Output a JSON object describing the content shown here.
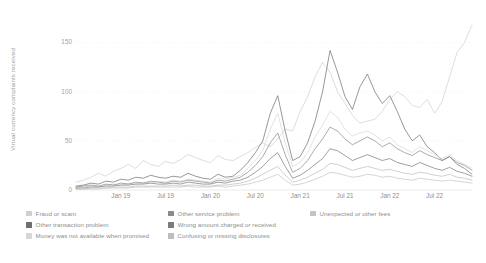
{
  "chart_data": {
    "type": "line",
    "title": "",
    "xlabel": "",
    "ylabel": "Virtual currency complaints received",
    "ylim": [
      0,
      175
    ],
    "yticks": [
      0,
      50,
      100,
      150
    ],
    "ytick_labels": [
      "0",
      "50",
      "100",
      "150"
    ],
    "xtick_labels": [
      "Jan 19",
      "Jul 19",
      "Jan 20",
      "Jul 20",
      "Jan 21",
      "Jul 21",
      "Jan 22",
      "Jul 22"
    ],
    "xtick_positions": [
      6,
      12,
      18,
      24,
      30,
      36,
      42,
      48
    ],
    "x": [
      0,
      1,
      2,
      3,
      4,
      5,
      6,
      7,
      8,
      9,
      10,
      11,
      12,
      13,
      14,
      15,
      16,
      17,
      18,
      19,
      20,
      21,
      22,
      23,
      24,
      25,
      26,
      27,
      28,
      29,
      30,
      31,
      32,
      33,
      34,
      35,
      36,
      37,
      38,
      39,
      40,
      41,
      42,
      43,
      44,
      45,
      46,
      47,
      48,
      49,
      50,
      51,
      52,
      53
    ],
    "grid": true,
    "legend_position": "bottom",
    "legend_columns": 3,
    "series": [
      {
        "name": "Fraud or scam",
        "color": "#cfcfcf",
        "values": [
          8,
          10,
          13,
          17,
          14,
          19,
          22,
          26,
          22,
          30,
          26,
          24,
          29,
          27,
          31,
          36,
          33,
          30,
          28,
          35,
          31,
          30,
          34,
          38,
          43,
          48,
          44,
          52,
          62,
          60,
          80,
          95,
          115,
          130,
          120,
          100,
          88,
          76,
          68,
          70,
          72,
          80,
          92,
          100,
          95,
          86,
          84,
          92,
          78,
          90,
          115,
          140,
          150,
          168
        ]
      },
      {
        "name": "Other transaction problem",
        "color": "#6f6f6f",
        "values": [
          4,
          5,
          7,
          6,
          9,
          8,
          11,
          10,
          13,
          12,
          15,
          13,
          12,
          14,
          13,
          17,
          14,
          12,
          11,
          16,
          13,
          14,
          20,
          28,
          38,
          50,
          78,
          96,
          60,
          30,
          34,
          48,
          70,
          100,
          142,
          120,
          95,
          82,
          105,
          118,
          100,
          88,
          96,
          80,
          62,
          50,
          56,
          44,
          38,
          30,
          34,
          26,
          22,
          16
        ]
      },
      {
        "name": "Money was not available when promised",
        "color": "#d6d6d6",
        "values": [
          2,
          3,
          4,
          3,
          5,
          6,
          5,
          7,
          6,
          8,
          7,
          9,
          8,
          10,
          9,
          11,
          10,
          9,
          8,
          12,
          11,
          13,
          15,
          22,
          30,
          40,
          62,
          78,
          48,
          24,
          28,
          38,
          54,
          66,
          80,
          74,
          62,
          55,
          58,
          60,
          56,
          50,
          54,
          46,
          42,
          38,
          44,
          40,
          36,
          32,
          36,
          30,
          26,
          22
        ]
      },
      {
        "name": "Other service problem",
        "color": "#8a8a8a",
        "values": [
          3,
          4,
          5,
          4,
          6,
          5,
          7,
          6,
          8,
          7,
          9,
          8,
          7,
          9,
          8,
          10,
          9,
          8,
          7,
          10,
          9,
          11,
          13,
          18,
          25,
          34,
          48,
          58,
          36,
          18,
          22,
          30,
          42,
          52,
          64,
          60,
          52,
          46,
          50,
          54,
          50,
          44,
          48,
          42,
          38,
          35,
          40,
          36,
          33,
          30,
          34,
          28,
          25,
          20
        ]
      },
      {
        "name": "Wrong amount charged or received",
        "color": "#7b7b7b",
        "values": [
          2,
          2,
          3,
          3,
          4,
          4,
          5,
          5,
          6,
          6,
          7,
          6,
          6,
          7,
          6,
          8,
          7,
          6,
          6,
          8,
          7,
          9,
          10,
          13,
          18,
          24,
          32,
          38,
          24,
          12,
          15,
          20,
          26,
          32,
          42,
          40,
          35,
          30,
          33,
          36,
          33,
          30,
          32,
          28,
          26,
          24,
          28,
          25,
          22,
          20,
          23,
          19,
          17,
          14
        ]
      },
      {
        "name": "Confusing or missing disclosures",
        "color": "#bdbdbd",
        "values": [
          1,
          1,
          2,
          2,
          2,
          3,
          3,
          3,
          4,
          4,
          4,
          4,
          4,
          5,
          4,
          5,
          5,
          4,
          4,
          5,
          5,
          6,
          7,
          9,
          12,
          16,
          20,
          24,
          15,
          8,
          10,
          13,
          17,
          21,
          27,
          26,
          23,
          20,
          22,
          24,
          22,
          20,
          21,
          19,
          17,
          16,
          18,
          17,
          15,
          14,
          16,
          13,
          12,
          10
        ]
      },
      {
        "name": "Unexpected or other fees",
        "color": "#c4c4c4",
        "values": [
          1,
          1,
          1,
          1,
          2,
          2,
          2,
          2,
          3,
          3,
          3,
          3,
          3,
          3,
          3,
          4,
          3,
          3,
          3,
          4,
          3,
          4,
          5,
          6,
          8,
          10,
          13,
          16,
          10,
          5,
          6,
          8,
          11,
          14,
          18,
          17,
          15,
          13,
          14,
          16,
          15,
          13,
          14,
          12,
          11,
          10,
          12,
          11,
          10,
          9,
          10,
          9,
          8,
          7
        ]
      }
    ]
  },
  "legend": {
    "columns": [
      {
        "items": [
          "Fraud or scam",
          "Other transaction problem",
          "Money was not available when promised"
        ]
      },
      {
        "items": [
          "Other service problem",
          "Wrong amount charged or received",
          "Confusing or missing disclosures"
        ]
      },
      {
        "items": [
          "Unexpected or other fees"
        ]
      }
    ]
  }
}
